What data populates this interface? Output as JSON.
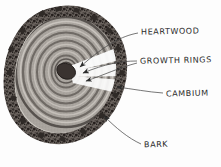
{
  "figure": {
    "medium": "hand-drawn pencil sketch",
    "background_color": "#fdfdfd",
    "ink_color": "#2b2b2b"
  },
  "labels": [
    {
      "id": "heartwood",
      "text": "HEARTWOOD",
      "points_to": "dark core at center of disc"
    },
    {
      "id": "growth_rings",
      "text": "GROWTH RINGS",
      "points_to": "concentric rings between core and bark"
    },
    {
      "id": "cambium",
      "text": "CAMBIUM",
      "points_to": "thin light layer just inside the bark"
    },
    {
      "id": "bark",
      "text": "BARK",
      "points_to": "dark rough outer band of the disc"
    }
  ],
  "diagram": {
    "parts": [
      {
        "name": "heartwood",
        "color": "#3a3330"
      },
      {
        "name": "growth-rings",
        "color": "#8d8984"
      },
      {
        "name": "cambium",
        "color": "#cfccc6"
      },
      {
        "name": "bark",
        "color": "#4a4542"
      }
    ],
    "ring_count": 11,
    "disc_center_x": 66,
    "disc_center_y": 73,
    "disc_radius_x": 57,
    "disc_radius_y": 63
  }
}
